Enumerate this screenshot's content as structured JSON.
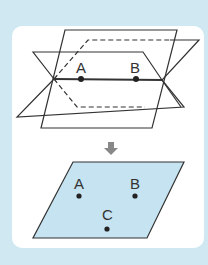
{
  "figure": {
    "top": {
      "description": "Three planes intersecting along line AB",
      "points": [
        {
          "label": "A",
          "x": 81,
          "y": 79
        },
        {
          "label": "B",
          "x": 136,
          "y": 79
        }
      ]
    },
    "arrow": {
      "icon": "arrow-down-icon"
    },
    "bottom": {
      "description": "One plane through non-collinear points A, B, C",
      "points": [
        {
          "label": "A",
          "x": 79,
          "y": 196
        },
        {
          "label": "B",
          "x": 135,
          "y": 196
        },
        {
          "label": "C",
          "x": 107,
          "y": 229
        }
      ]
    }
  },
  "colors": {
    "background": "#cfe8f2",
    "card": "#ffffff",
    "plane_fill": "#c5e3f0",
    "line": "#333333",
    "arrow": "#888888"
  }
}
